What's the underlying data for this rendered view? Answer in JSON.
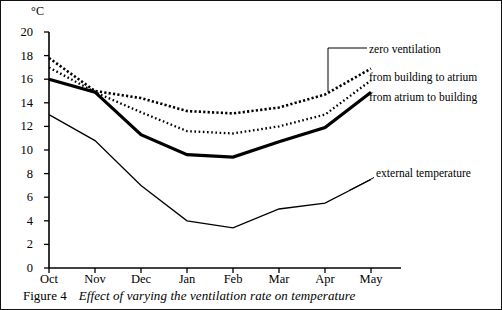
{
  "figure": {
    "caption_number": "Figure 4",
    "caption_text": "Effect of varying the ventilation rate on temperature"
  },
  "chart_data": {
    "type": "line",
    "title": "",
    "subtitle": "",
    "xlabel": "",
    "ylabel": "°C",
    "y_unit_label": "°C",
    "categories": [
      "Oct",
      "Nov",
      "Dec",
      "Jan",
      "Feb",
      "Mar",
      "Apr",
      "May"
    ],
    "xticklabels": [
      "Oct",
      "Nov",
      "Dec",
      "Jan",
      "Feb",
      "Mar",
      "Apr",
      "May"
    ],
    "yticks": [
      0,
      2,
      4,
      6,
      8,
      10,
      12,
      14,
      16,
      18,
      20
    ],
    "yticklabels": [
      "0",
      "2",
      "4",
      "6",
      "8",
      "10",
      "12",
      "14",
      "16",
      "18",
      "20"
    ],
    "ylim": [
      0,
      20
    ],
    "grid": false,
    "legend_position": "right-inline-labels",
    "series": [
      {
        "name": "zero ventilation",
        "style": "coarse-dashed",
        "values": [
          17.8,
          15.0,
          14.4,
          13.3,
          13.1,
          13.6,
          14.7,
          16.9
        ]
      },
      {
        "name": "from building to atrium",
        "style": "fine-dotted",
        "values": [
          17.0,
          14.9,
          13.2,
          11.6,
          11.4,
          12.0,
          13.0,
          15.9
        ]
      },
      {
        "name": "from atrium to building",
        "style": "thick-solid",
        "values": [
          16.0,
          14.9,
          11.3,
          9.6,
          9.4,
          10.7,
          11.9,
          14.9
        ]
      },
      {
        "name": "external temperature",
        "style": "thin-solid",
        "values": [
          13.0,
          10.8,
          7.0,
          4.0,
          3.4,
          5.0,
          5.5,
          7.5
        ]
      }
    ],
    "annotations": [
      {
        "text": "zero ventilation",
        "series": "zero ventilation"
      },
      {
        "text": "from building to atrium",
        "series": "from building to atrium"
      },
      {
        "text": "from atrium to building",
        "series": "from atrium to building"
      },
      {
        "text": "external temperature",
        "series": "external temperature"
      }
    ],
    "colors": {
      "line": "#000000",
      "axis": "#000000",
      "background": "#ffffff",
      "border": "#111111"
    }
  }
}
